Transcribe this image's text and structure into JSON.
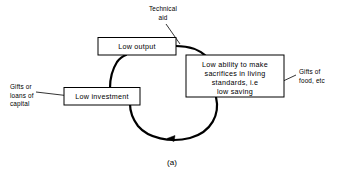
{
  "figure": {
    "caption": "(a)",
    "background_color": "#ffffff",
    "line_color": "#000000"
  },
  "boxes": [
    {
      "id": "low-output",
      "lines": [
        "Low output"
      ]
    },
    {
      "id": "low-ability-to-make-sacrifices",
      "lines": [
        "Low ability to make",
        "sacrifices in living",
        "standards, i.e",
        "low saving"
      ]
    },
    {
      "id": "low-investment",
      "lines": [
        "Low investment"
      ]
    }
  ],
  "annotations": [
    {
      "id": "technical-aid",
      "lines": [
        "Technical",
        "aid"
      ]
    },
    {
      "id": "gifts-of-food",
      "lines": [
        "Gifts of",
        "food, etc"
      ]
    },
    {
      "id": "gifts-or-loans-of-capital",
      "lines": [
        "Gifts or",
        "loans of",
        "capital"
      ]
    }
  ]
}
